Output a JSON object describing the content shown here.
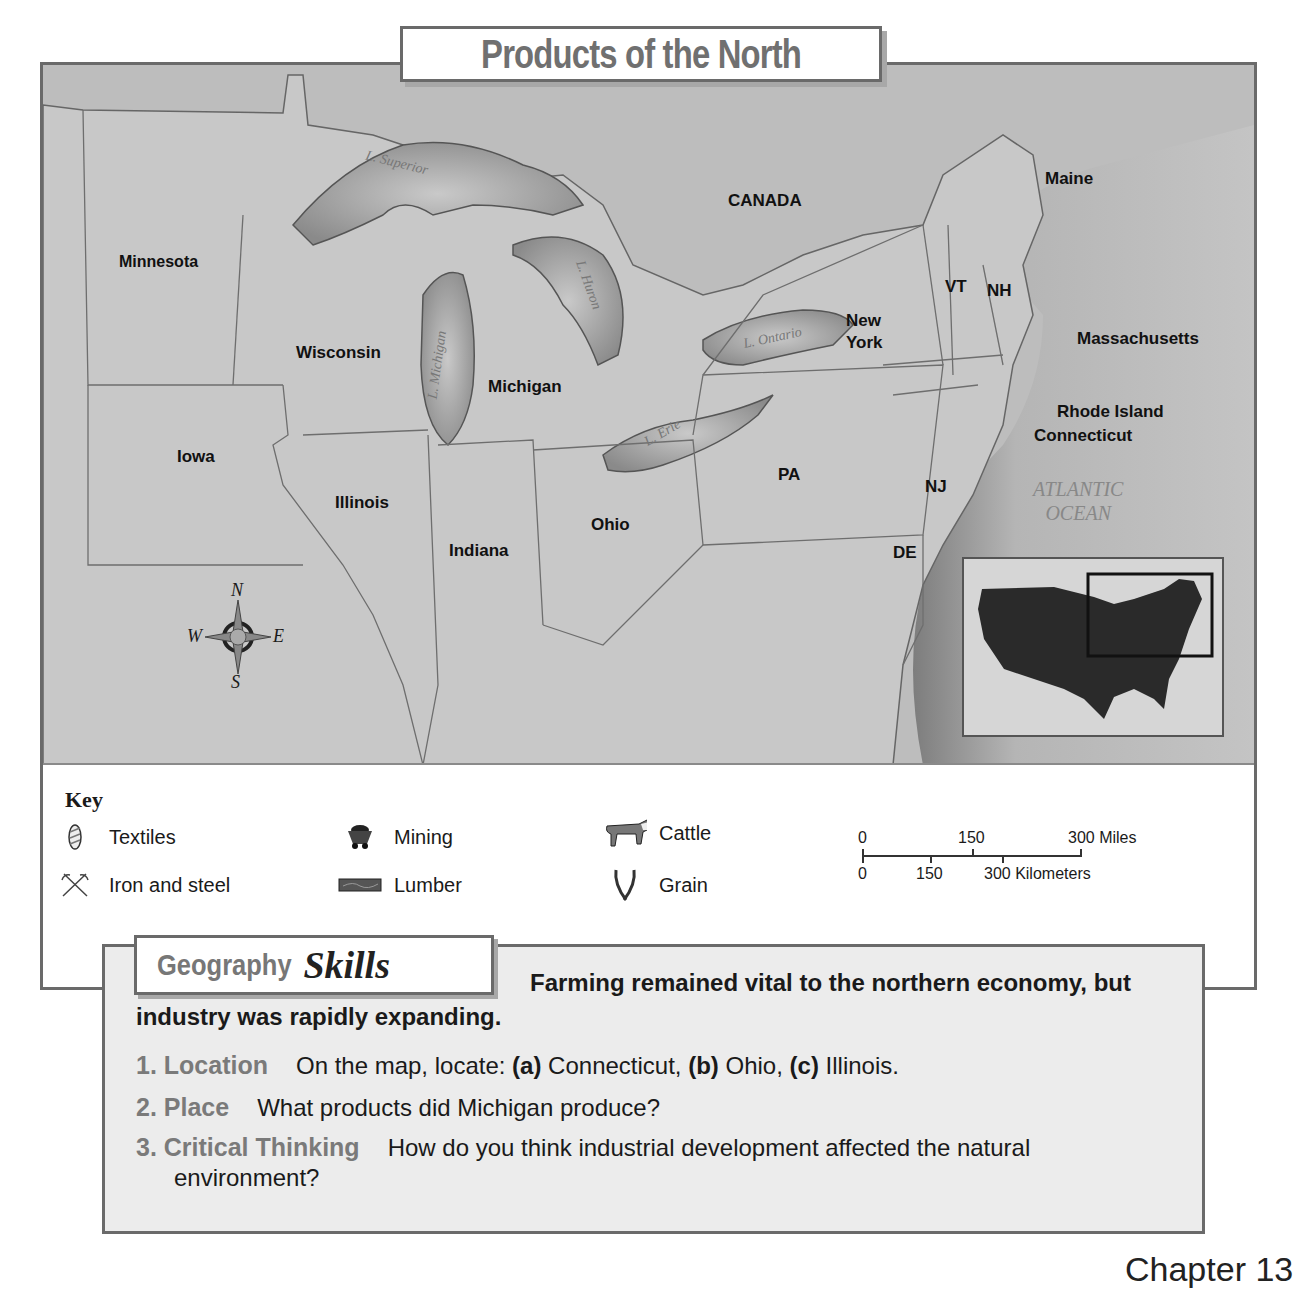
{
  "title": "Products of the North",
  "map": {
    "regions": {
      "canada": "CANADA",
      "minnesota": "Minnesota",
      "wisconsin": "Wisconsin",
      "michigan": "Michigan",
      "iowa": "Iowa",
      "illinois": "Illinois",
      "indiana": "Indiana",
      "ohio": "Ohio",
      "pa": "PA",
      "new_york_1": "New",
      "new_york_2": "York",
      "vt": "VT",
      "nh": "NH",
      "maine": "Maine",
      "massachusetts": "Massachusetts",
      "rhode_island": "Rhode Island",
      "connecticut": "Connecticut",
      "nj": "NJ",
      "de": "DE"
    },
    "water": {
      "superior": "L. Superior",
      "michigan": "L. Michigan",
      "huron": "L. Huron",
      "erie": "L. Erie",
      "ontario": "L. Ontario",
      "ocean_1": "ATLANTIC",
      "ocean_2": "OCEAN"
    },
    "compass": {
      "n": "N",
      "s": "S",
      "e": "E",
      "w": "W"
    }
  },
  "key": {
    "title": "Key",
    "items": [
      {
        "icon": "textiles-icon",
        "label": "Textiles"
      },
      {
        "icon": "iron-steel-icon",
        "label": "Iron and steel"
      },
      {
        "icon": "mining-icon",
        "label": "Mining"
      },
      {
        "icon": "lumber-icon",
        "label": "Lumber"
      },
      {
        "icon": "cattle-icon",
        "label": "Cattle"
      },
      {
        "icon": "grain-icon",
        "label": "Grain"
      }
    ]
  },
  "scale": {
    "miles": [
      "0",
      "150",
      "300 Miles"
    ],
    "km": [
      "0",
      "150",
      "300 Kilometers"
    ]
  },
  "skills": {
    "tab_word1": "Geography",
    "tab_word2": "Skills",
    "intro": "Farming remained vital to the northern economy, but industry was rapidly expanding.",
    "questions": [
      {
        "head": "1. Location",
        "pre": "On the map, locate: ",
        "a": "(a)",
        "a_txt": " Connecticut, ",
        "b": "(b)",
        "b_txt": " Ohio, ",
        "c": "(c)",
        "c_txt": " Illinois."
      },
      {
        "head": "2. Place",
        "text": "What products did Michigan produce?"
      },
      {
        "head": "3. Critical Thinking",
        "text": "How do you think industrial development affected the natural environment?"
      }
    ]
  },
  "footer": "Chapter 13"
}
